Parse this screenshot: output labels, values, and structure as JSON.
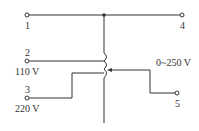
{
  "diagram": {
    "type": "autotransformer-schematic",
    "line_color": "#333333",
    "terminals": [
      {
        "id": "1",
        "label": "1"
      },
      {
        "id": "2",
        "label": "2",
        "voltage": "110 V"
      },
      {
        "id": "3",
        "label": "3",
        "voltage": "220 V"
      },
      {
        "id": "4",
        "label": "4"
      },
      {
        "id": "5",
        "label": "5"
      }
    ],
    "output_range": "0~250 V"
  }
}
